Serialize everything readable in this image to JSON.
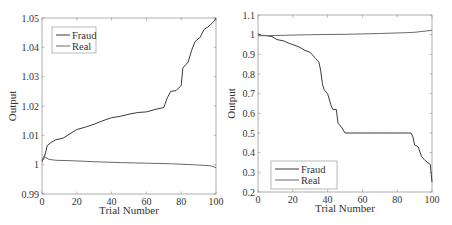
{
  "chart_data": [
    {
      "type": "line",
      "title": "",
      "xlabel": "Trial Number",
      "ylabel": "Output",
      "xlim": [
        0,
        100
      ],
      "ylim": [
        0.99,
        1.05
      ],
      "xticks": [
        "0",
        "20",
        "40",
        "60",
        "80",
        "100"
      ],
      "yticks": [
        "0.99",
        "1",
        "1.01",
        "1.02",
        "1.03",
        "1.04",
        "1.05"
      ],
      "grid": false,
      "legend_position": "upper-left",
      "legend": [
        "Fraud",
        "Real"
      ],
      "series": [
        {
          "name": "Fraud",
          "x": [
            0,
            1,
            2,
            3,
            5,
            8,
            12,
            16,
            20,
            25,
            30,
            35,
            40,
            45,
            50,
            55,
            60,
            65,
            70,
            72,
            74,
            77,
            80,
            81,
            84,
            86,
            88,
            91,
            93,
            96,
            99,
            100
          ],
          "values": [
            1.001,
            1.002,
            1.004,
            1.0065,
            1.0075,
            1.0085,
            1.009,
            1.0105,
            1.012,
            1.0128,
            1.0138,
            1.015,
            1.016,
            1.0165,
            1.0172,
            1.0178,
            1.018,
            1.0188,
            1.0195,
            1.0228,
            1.025,
            1.0252,
            1.027,
            1.033,
            1.035,
            1.039,
            1.042,
            1.0435,
            1.046,
            1.0472,
            1.049,
            1.05
          ]
        },
        {
          "name": "Real",
          "x": [
            0,
            1,
            2,
            4,
            8,
            15,
            30,
            45,
            60,
            75,
            90,
            97,
            100
          ],
          "values": [
            1.0015,
            1.0027,
            1.0025,
            1.0018,
            1.0015,
            1.0014,
            1.001,
            1.0007,
            1.0005,
            1.0003,
            0.9999,
            0.9996,
            0.999
          ]
        }
      ]
    },
    {
      "type": "line",
      "title": "",
      "xlabel": "Trial Number",
      "ylabel": "Output",
      "xlim": [
        0,
        100
      ],
      "ylim": [
        0.2,
        1.1
      ],
      "xticks": [
        "0",
        "20",
        "40",
        "60",
        "80",
        "100"
      ],
      "yticks": [
        "0.2",
        "0.3",
        "0.4",
        "0.5",
        "0.6",
        "0.7",
        "0.8",
        "0.9",
        "1",
        "1.1"
      ],
      "grid": false,
      "legend_position": "lower-left",
      "legend": [
        "Fraud",
        "Real"
      ],
      "series": [
        {
          "name": "Fraud",
          "x": [
            0,
            2,
            5,
            8,
            11,
            15,
            18,
            20,
            24,
            27,
            30,
            33,
            35,
            36,
            37,
            38,
            40,
            42,
            43,
            45,
            46,
            48,
            50,
            60,
            70,
            80,
            88,
            89,
            90,
            92,
            94,
            96,
            99,
            100
          ],
          "values": [
            1.005,
            0.997,
            0.995,
            0.99,
            0.975,
            0.968,
            0.955,
            0.95,
            0.935,
            0.92,
            0.91,
            0.88,
            0.86,
            0.82,
            0.75,
            0.72,
            0.7,
            0.64,
            0.62,
            0.62,
            0.55,
            0.53,
            0.5,
            0.5,
            0.5,
            0.5,
            0.5,
            0.48,
            0.44,
            0.43,
            0.38,
            0.36,
            0.34,
            0.25
          ]
        },
        {
          "name": "Real",
          "x": [
            0,
            2,
            10,
            30,
            50,
            70,
            85,
            90,
            100
          ],
          "values": [
            0.995,
            0.995,
            0.996,
            1.0,
            1.002,
            1.006,
            1.01,
            1.012,
            1.022
          ]
        }
      ]
    }
  ],
  "colors": {
    "fraud": "#3a3a3a",
    "real": "#6a6a6a",
    "axis": "#9a9a9a"
  }
}
